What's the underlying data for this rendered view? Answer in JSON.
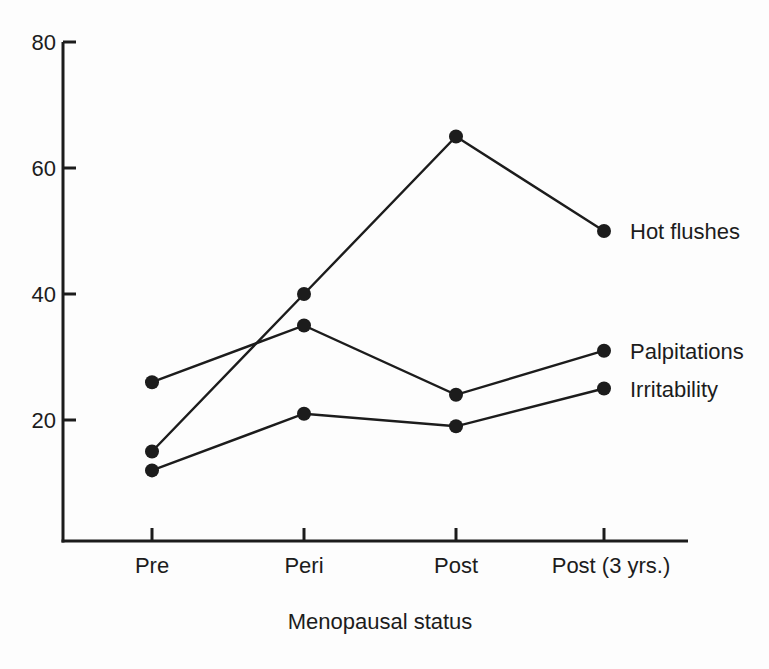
{
  "figure": {
    "background": "#fdfdfd",
    "ink_color": "#1c1c1c"
  },
  "chart_data": {
    "type": "line",
    "title": "",
    "xlabel": "Menopausal status",
    "ylabel": "",
    "categories": [
      "Pre",
      "Peri",
      "Post",
      "Post (3 yrs.)"
    ],
    "series": [
      {
        "name": "Hot flushes",
        "values": [
          15,
          40,
          65,
          50
        ]
      },
      {
        "name": "Palpitations",
        "values": [
          26,
          35,
          24,
          31
        ]
      },
      {
        "name": "Irritability",
        "values": [
          12,
          21,
          19,
          25
        ]
      }
    ],
    "ylim": [
      0,
      80
    ],
    "yticks": [
      20,
      40,
      60,
      80
    ],
    "grid": false,
    "legend_position": "labels-right-of-last-points",
    "marker": "filled-circle",
    "line_color": "#1c1c1c"
  }
}
